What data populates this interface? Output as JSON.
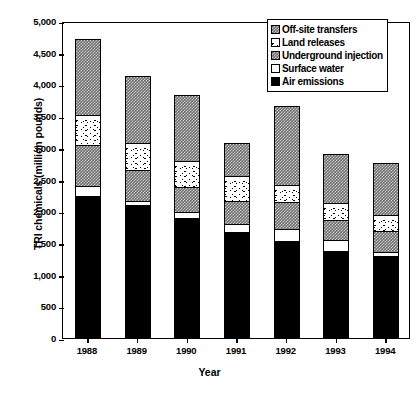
{
  "chart_data": {
    "type": "bar",
    "subtype": "stacked-vertical",
    "title": "",
    "xlabel": "Year",
    "ylabel": "TRI chemicals (million pounds)",
    "categories": [
      "1988",
      "1989",
      "1990",
      "1991",
      "1992",
      "1993",
      "1994"
    ],
    "ylim": [
      0,
      5000
    ],
    "ytick_step": 500,
    "ytick_labels": [
      "5,000",
      "4,500",
      "4,000",
      "3,500",
      "3,000",
      "2,500",
      "2,000",
      "1,500",
      "1,000",
      "500",
      "0"
    ],
    "ytick_values": [
      5000,
      4500,
      4000,
      3500,
      3000,
      2500,
      2000,
      1500,
      1000,
      500,
      0
    ],
    "grid": false,
    "legend_position": "top-right",
    "stack_order_bottom_to_top": [
      "Air emissions",
      "Surface water",
      "Underground injection",
      "Land releases",
      "Off-site transfers"
    ],
    "series": [
      {
        "name": "Air emissions",
        "fill": "solid-black",
        "values": [
          2250,
          2110,
          1910,
          1680,
          1550,
          1380,
          1310
        ]
      },
      {
        "name": "Surface water",
        "fill": "white",
        "values": [
          170,
          70,
          90,
          130,
          190,
          180,
          60
        ]
      },
      {
        "name": "Underground injection",
        "fill": "gray-checker",
        "values": [
          640,
          490,
          390,
          370,
          420,
          310,
          330
        ]
      },
      {
        "name": "Land releases",
        "fill": "speckle",
        "values": [
          470,
          420,
          410,
          390,
          270,
          270,
          260
        ]
      },
      {
        "name": "Off-site transfers",
        "fill": "gray-checker",
        "values": [
          1190,
          1050,
          1030,
          510,
          1230,
          770,
          800
        ]
      }
    ],
    "totals": [
      4720,
      4140,
      3830,
      3080,
      3660,
      2910,
      2760
    ]
  },
  "legend": {
    "items": [
      {
        "label": "Off-site transfers",
        "swatch": "gray-checker-swatch"
      },
      {
        "label": "Land releases",
        "swatch": "speckle-swatch"
      },
      {
        "label": "Underground injection",
        "swatch": "gray-checker-swatch"
      },
      {
        "label": "Surface water",
        "swatch": "white-swatch"
      },
      {
        "label": "Air emissions",
        "swatch": "black-swatch"
      }
    ]
  },
  "colors": {
    "axis": "#000000",
    "black_fill": "#000000",
    "gray_fill": "#6e6e6e",
    "white_fill": "#ffffff",
    "background": "#ffffff"
  }
}
